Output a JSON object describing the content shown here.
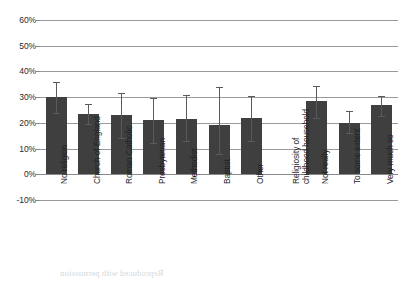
{
  "chart_data": {
    "type": "bar",
    "title": "",
    "subtitle": "",
    "xlabel": "",
    "ylabel": "",
    "ylim": [
      -10,
      60
    ],
    "grid": true,
    "legend": false,
    "ytick_labels": [
      "60%",
      "50%",
      "40%",
      "30%",
      "20%",
      "10%",
      "0%",
      "-10%"
    ],
    "ytick_values": [
      60,
      50,
      40,
      30,
      20,
      10,
      0,
      -10
    ],
    "categories": [
      "No religion",
      "Church of England",
      "Roman Catholic",
      "Presbyterian",
      "Methodist",
      "Baptist",
      "Other",
      "Religiosity of childhood household",
      "Not really",
      "To some extent",
      "Very much so"
    ],
    "values": [
      30,
      23.5,
      23,
      21,
      21.5,
      19,
      22,
      null,
      28.5,
      20,
      27
    ],
    "errors_low": [
      24,
      19.5,
      14,
      12,
      13,
      8,
      13,
      null,
      22,
      16,
      22.5
    ],
    "errors_high": [
      36,
      27.5,
      31.5,
      29.5,
      31,
      34,
      30.5,
      null,
      34.5,
      24.5,
      30.5
    ],
    "bar_color": "#3f3f3f",
    "error_color": "#5a5a5a",
    "grid_color": "#9a9a9a",
    "axis_text_color": "#1f1f1f",
    "group_header_index": 7,
    "note": "Category at index 7 is a group heading with no bar plotted."
  }
}
